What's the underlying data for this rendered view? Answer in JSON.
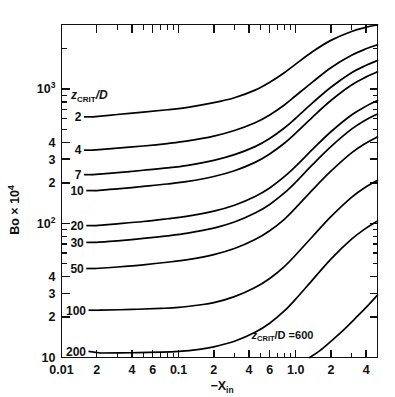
{
  "chart_data": {
    "type": "line",
    "title": "",
    "xlabel": "-X_in",
    "xlabel_parts": {
      "main": "−X",
      "sub": "in"
    },
    "ylabel": "Bo × 10^4",
    "ylabel_parts": {
      "main": "Bo × 10",
      "sup": "4"
    },
    "xscale": "log",
    "yscale": "log",
    "xlim": [
      0.01,
      5.0
    ],
    "ylim": [
      10,
      3020
    ],
    "grid": false,
    "legend_position": "inline-labels",
    "x_ticks_major": [
      {
        "value": 0.01,
        "label": "0.01"
      },
      {
        "value": 0.02,
        "label": "2"
      },
      {
        "value": 0.04,
        "label": "4"
      },
      {
        "value": 0.06,
        "label": "6"
      },
      {
        "value": 0.1,
        "label": "0.1"
      },
      {
        "value": 0.2,
        "label": "2"
      },
      {
        "value": 0.4,
        "label": "4"
      },
      {
        "value": 0.6,
        "label": "6"
      },
      {
        "value": 1.0,
        "label": "1.0"
      },
      {
        "value": 2.0,
        "label": "2"
      },
      {
        "value": 4.0,
        "label": "4"
      }
    ],
    "x_ticks_minor": [
      0.03,
      0.05,
      0.07,
      0.08,
      0.09,
      0.3,
      0.5,
      0.7,
      0.8,
      0.9,
      3.0,
      5.0
    ],
    "y_ticks_major": [
      {
        "value": 10,
        "label": "10",
        "sup": ""
      },
      {
        "value": 20,
        "label": "2",
        "sup": ""
      },
      {
        "value": 30,
        "label": "3",
        "sup": ""
      },
      {
        "value": 40,
        "label": "4",
        "sup": ""
      },
      {
        "value": 100,
        "label": "10",
        "sup": "2"
      },
      {
        "value": 200,
        "label": "2",
        "sup": ""
      },
      {
        "value": 300,
        "label": "3",
        "sup": ""
      },
      {
        "value": 400,
        "label": "4",
        "sup": ""
      },
      {
        "value": 1000,
        "label": "10",
        "sup": "3"
      }
    ],
    "y_ticks_minor": [
      50,
      60,
      70,
      80,
      90,
      500,
      600,
      700,
      800,
      900,
      2000,
      3000
    ],
    "key_label": {
      "main": "z",
      "sub": "CRIT",
      "div": "/D"
    },
    "series": [
      {
        "name": "2",
        "label": "2",
        "label_x": 0.0148,
        "label_y": 620,
        "points": [
          [
            0.0185,
            620
          ],
          [
            0.03,
            645
          ],
          [
            0.05,
            672
          ],
          [
            0.08,
            700
          ],
          [
            0.12,
            730
          ],
          [
            0.2,
            790
          ],
          [
            0.3,
            860
          ],
          [
            0.45,
            980
          ],
          [
            0.6,
            1120
          ],
          [
            0.8,
            1320
          ],
          [
            1.0,
            1530
          ],
          [
            1.4,
            1900
          ],
          [
            2.0,
            2300
          ],
          [
            3.0,
            2680
          ],
          [
            4.0,
            2880
          ],
          [
            5.0,
            3000
          ]
        ]
      },
      {
        "name": "4",
        "label": "4",
        "label_x": 0.0148,
        "label_y": 350,
        "points": [
          [
            0.0185,
            350
          ],
          [
            0.03,
            362
          ],
          [
            0.05,
            376
          ],
          [
            0.08,
            392
          ],
          [
            0.12,
            410
          ],
          [
            0.2,
            445
          ],
          [
            0.3,
            490
          ],
          [
            0.45,
            560
          ],
          [
            0.6,
            640
          ],
          [
            0.8,
            760
          ],
          [
            1.0,
            890
          ],
          [
            1.4,
            1130
          ],
          [
            2.0,
            1440
          ],
          [
            3.0,
            1780
          ],
          [
            4.0,
            1990
          ],
          [
            5.0,
            2130
          ]
        ]
      },
      {
        "name": "7",
        "label": "7",
        "label_x": 0.0148,
        "label_y": 230,
        "points": [
          [
            0.0185,
            230
          ],
          [
            0.03,
            238
          ],
          [
            0.05,
            248
          ],
          [
            0.08,
            258
          ],
          [
            0.12,
            270
          ],
          [
            0.2,
            294
          ],
          [
            0.3,
            324
          ],
          [
            0.45,
            372
          ],
          [
            0.6,
            428
          ],
          [
            0.8,
            512
          ],
          [
            1.0,
            605
          ],
          [
            1.4,
            790
          ],
          [
            2.0,
            1030
          ],
          [
            3.0,
            1320
          ],
          [
            4.0,
            1500
          ],
          [
            5.0,
            1630
          ]
        ]
      },
      {
        "name": "10",
        "label": "10",
        "label_x": 0.0155,
        "label_y": 175,
        "points": [
          [
            0.0195,
            175
          ],
          [
            0.03,
            180
          ],
          [
            0.05,
            188
          ],
          [
            0.08,
            196
          ],
          [
            0.12,
            205
          ],
          [
            0.2,
            223
          ],
          [
            0.3,
            246
          ],
          [
            0.45,
            284
          ],
          [
            0.6,
            328
          ],
          [
            0.8,
            394
          ],
          [
            1.0,
            468
          ],
          [
            1.4,
            620
          ],
          [
            2.0,
            820
          ],
          [
            3.0,
            1070
          ],
          [
            4.0,
            1230
          ],
          [
            5.0,
            1340
          ]
        ]
      },
      {
        "name": "20",
        "label": "20",
        "label_x": 0.0155,
        "label_y": 96,
        "points": [
          [
            0.0195,
            96
          ],
          [
            0.03,
            99
          ],
          [
            0.05,
            103
          ],
          [
            0.08,
            108
          ],
          [
            0.12,
            113
          ],
          [
            0.2,
            123
          ],
          [
            0.3,
            136
          ],
          [
            0.45,
            158
          ],
          [
            0.6,
            183
          ],
          [
            0.8,
            222
          ],
          [
            1.0,
            265
          ],
          [
            1.4,
            356
          ],
          [
            2.0,
            480
          ],
          [
            3.0,
            640
          ],
          [
            4.0,
            745
          ],
          [
            5.0,
            820
          ]
        ]
      },
      {
        "name": "30",
        "label": "30",
        "label_x": 0.0155,
        "label_y": 72,
        "points": [
          [
            0.0195,
            72
          ],
          [
            0.03,
            74
          ],
          [
            0.05,
            77
          ],
          [
            0.08,
            80.5
          ],
          [
            0.12,
            84.5
          ],
          [
            0.2,
            92
          ],
          [
            0.3,
            102
          ],
          [
            0.45,
            119
          ],
          [
            0.6,
            138
          ],
          [
            0.8,
            168
          ],
          [
            1.0,
            202
          ],
          [
            1.4,
            274
          ],
          [
            2.0,
            372
          ],
          [
            3.0,
            502
          ],
          [
            4.0,
            590
          ],
          [
            5.0,
            652
          ]
        ]
      },
      {
        "name": "50",
        "label": "50",
        "label_x": 0.0155,
        "label_y": 46,
        "points": [
          [
            0.0195,
            46
          ],
          [
            0.03,
            47.2
          ],
          [
            0.05,
            49
          ],
          [
            0.08,
            51.2
          ],
          [
            0.12,
            53.6
          ],
          [
            0.2,
            58.4
          ],
          [
            0.3,
            64.8
          ],
          [
            0.45,
            75.6
          ],
          [
            0.6,
            88
          ],
          [
            0.8,
            107
          ],
          [
            1.0,
            130
          ],
          [
            1.4,
            178
          ],
          [
            2.0,
            244
          ],
          [
            3.0,
            334
          ],
          [
            4.0,
            396
          ],
          [
            5.0,
            440
          ]
        ]
      },
      {
        "name": "100",
        "label": "100",
        "label_x": 0.0162,
        "label_y": 22.5,
        "points": [
          [
            0.0215,
            22.5
          ],
          [
            0.04,
            22.8
          ],
          [
            0.07,
            23.2
          ],
          [
            0.1,
            23.6
          ],
          [
            0.15,
            24.6
          ],
          [
            0.2,
            25.6
          ],
          [
            0.3,
            28.4
          ],
          [
            0.45,
            33.2
          ],
          [
            0.6,
            38.8
          ],
          [
            0.8,
            47.6
          ],
          [
            1.0,
            58
          ],
          [
            1.4,
            80
          ],
          [
            2.0,
            112
          ],
          [
            3.0,
            156
          ],
          [
            4.0,
            187
          ],
          [
            5.0,
            209
          ]
        ]
      },
      {
        "name": "200",
        "label": "200",
        "label_x": 0.0162,
        "label_y": 11.1,
        "points": [
          [
            0.0215,
            10.8
          ],
          [
            0.04,
            10.85
          ],
          [
            0.07,
            10.95
          ],
          [
            0.1,
            11.1
          ],
          [
            0.15,
            11.5
          ],
          [
            0.2,
            12.0
          ],
          [
            0.3,
            13.2
          ],
          [
            0.45,
            15.4
          ],
          [
            0.6,
            18.0
          ],
          [
            0.8,
            22.2
          ],
          [
            1.0,
            27.2
          ],
          [
            1.4,
            38
          ],
          [
            2.0,
            54
          ],
          [
            3.0,
            76
          ],
          [
            4.0,
            92
          ],
          [
            5.0,
            104
          ]
        ]
      },
      {
        "name": "600",
        "label": "",
        "annotation": {
          "main": "z",
          "sub": "CRIT",
          "tail": "/D =600"
        },
        "annot_x": 0.42,
        "annot_y": 13.8,
        "points": [
          [
            1.32,
            10
          ],
          [
            1.6,
            11.2
          ],
          [
            2.0,
            13.2
          ],
          [
            2.6,
            16.2
          ],
          [
            3.2,
            19.4
          ],
          [
            4.0,
            23.6
          ],
          [
            5.0,
            29.2
          ]
        ]
      }
    ]
  }
}
